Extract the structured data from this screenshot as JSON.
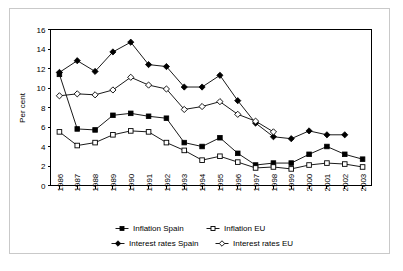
{
  "chart_data": {
    "type": "line",
    "title": "",
    "xlabel": "",
    "ylabel": "Per cent",
    "ylim": [
      0,
      16
    ],
    "yticks": [
      0,
      2,
      4,
      6,
      8,
      10,
      12,
      14,
      16
    ],
    "grid": false,
    "legend_position": "bottom",
    "categories": [
      "1986",
      "1987",
      "1988",
      "1989",
      "1990",
      "1991",
      "1992",
      "1993",
      "1994",
      "1995",
      "1996",
      "1997",
      "1998",
      "1999",
      "2000",
      "2001",
      "2002",
      "2003"
    ],
    "series": [
      {
        "name": "Inflation Spain",
        "marker": "filled-square",
        "values": [
          11.4,
          5.8,
          5.7,
          7.2,
          7.4,
          7.1,
          6.9,
          4.4,
          4.0,
          4.9,
          3.3,
          2.1,
          2.3,
          2.3,
          3.2,
          4.0,
          3.2,
          2.7
        ]
      },
      {
        "name": "Inflation EU",
        "marker": "open-square",
        "values": [
          5.5,
          4.1,
          4.4,
          5.2,
          5.6,
          5.5,
          4.4,
          3.6,
          2.6,
          3.0,
          2.4,
          1.8,
          1.9,
          1.7,
          2.1,
          2.3,
          2.2,
          1.9
        ]
      },
      {
        "name": "Interest rates Spain",
        "marker": "filled-diamond",
        "values": [
          11.6,
          12.8,
          11.7,
          13.7,
          14.7,
          12.4,
          12.2,
          10.1,
          10.1,
          11.3,
          8.7,
          6.4,
          5.0,
          4.8,
          5.6,
          5.2,
          5.2,
          null
        ]
      },
      {
        "name": "Interest rates EU",
        "marker": "open-diamond",
        "values": [
          9.2,
          9.4,
          9.3,
          9.8,
          11.1,
          10.3,
          9.9,
          7.8,
          8.1,
          8.6,
          7.3,
          6.6,
          5.5,
          null,
          null,
          null,
          null,
          null
        ]
      }
    ]
  },
  "legend": {
    "items": [
      {
        "label": "Inflation Spain",
        "marker": "filled-square"
      },
      {
        "label": "Inflation EU",
        "marker": "open-square"
      },
      {
        "label": "Interest rates Spain",
        "marker": "filled-diamond"
      },
      {
        "label": "Interest rates EU",
        "marker": "open-diamond"
      }
    ]
  }
}
